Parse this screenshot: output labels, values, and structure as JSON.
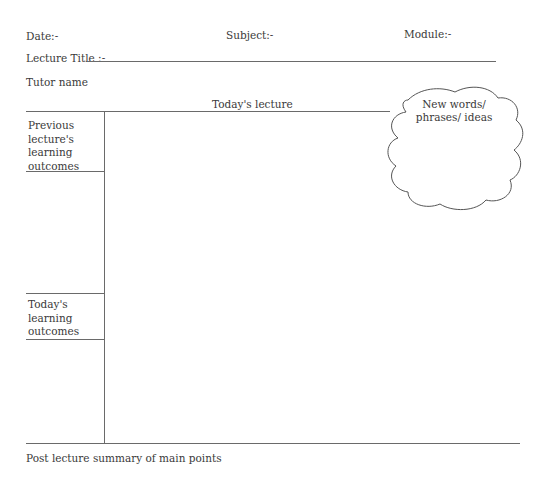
{
  "header": {
    "date_label": "Date:-",
    "subject_label": "Subject:-",
    "module_label": "Module:-",
    "lecture_title_label": "Lecture Title :-",
    "tutor_label": "Tutor name"
  },
  "main": {
    "todays_lecture_label": "Today's lecture"
  },
  "sidebar": {
    "previous_outcomes": [
      "Previous",
      "lecture's",
      "learning",
      "outcomes"
    ],
    "todays_outcomes": [
      "Today's",
      "learning",
      "outcomes"
    ]
  },
  "cloud": {
    "lines": [
      "New words/",
      "phrases/ ideas"
    ]
  },
  "footer": {
    "summary_label": "Post lecture summary of main points"
  }
}
